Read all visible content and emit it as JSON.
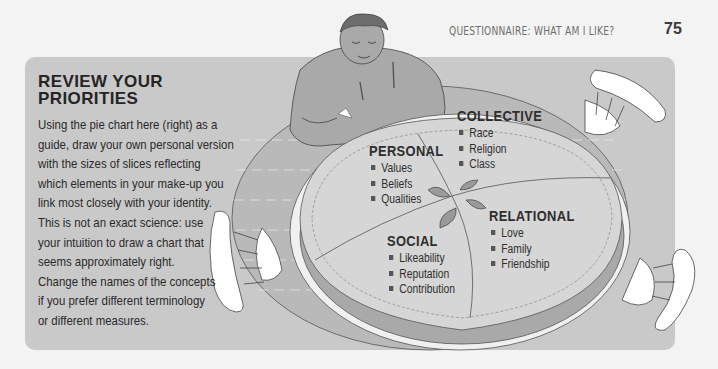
{
  "header": {
    "running_title": "QUESTIONNAIRE: WHAT AM I LIKE?",
    "page_number": "75"
  },
  "panel": {
    "title_line1": "REVIEW YOUR",
    "title_line2": "PRIORITIES",
    "body_lines": [
      "Using the pie chart here (right) as a",
      "guide, draw your own personal version",
      "with the sizes of slices reflecting",
      "which elements in your make-up you",
      "link most closely with your identity.",
      "This is not an exact science: use",
      "your intuition to draw a chart that",
      "seems approximately right.",
      "Change the names of the concepts",
      "if you prefer different terminology",
      "or different measures."
    ]
  },
  "pie": {
    "collective": {
      "heading": "COLLECTIVE",
      "items": [
        "Race",
        "Religion",
        "Class"
      ]
    },
    "personal": {
      "heading": "PERSONAL",
      "items": [
        "Values",
        "Beliefs",
        "Qualities"
      ]
    },
    "relational": {
      "heading": "RELATIONAL",
      "items": [
        "Love",
        "Family",
        "Friendship"
      ]
    },
    "social": {
      "heading": "SOCIAL",
      "items": [
        "Likeability",
        "Reputation",
        "Contribution"
      ]
    }
  },
  "colors": {
    "page_bg": "#f3f3f3",
    "panel_bg": "#c9c9c9",
    "table": "#b9b9b9",
    "pie_crust": "#d6d6d6",
    "pie_dark": "#a9a9a9",
    "text_dark": "#252525"
  }
}
